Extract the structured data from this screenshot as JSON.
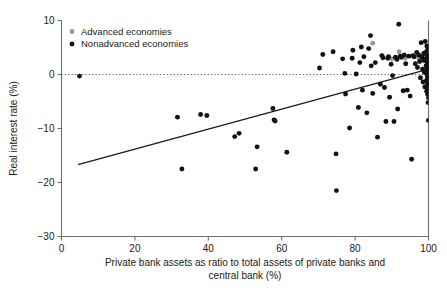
{
  "chart_data": {
    "type": "scatter",
    "title": "",
    "subtitle": "",
    "xlabel": "Private bank assets as ratio to total assets of private banks and central bank (%)",
    "xlabel_line1": "Private bank assets as ratio to total assets of private banks and",
    "xlabel_line2": "central bank (%)",
    "ylabel": "Real interest rate (%)",
    "xlim": [
      0,
      100
    ],
    "ylim": [
      -30,
      10
    ],
    "xticks": [
      0,
      20,
      40,
      60,
      80,
      100
    ],
    "xtick_labels": [
      "0",
      "20",
      "40",
      "60",
      "80",
      "100"
    ],
    "yticks": [
      10,
      0,
      -10,
      -20,
      -30
    ],
    "ytick_labels": [
      "10",
      "0",
      "-10",
      "-20",
      "-30"
    ],
    "grid": false,
    "zero_reference_line": {
      "y": 0,
      "style": "dotted",
      "color": "#555555"
    },
    "legend": {
      "position": "top-left",
      "entries": [
        {
          "name": "Advanced economies",
          "color": "#9a9a9a",
          "marker": "circle"
        },
        {
          "name": "Nonadvanced economies",
          "color": "#111111",
          "marker": "circle"
        }
      ]
    },
    "trendline": {
      "type": "linear",
      "color": "#1a1a1a",
      "x_start": 4.5,
      "y_start": -16.7,
      "x_end": 100.0,
      "y_end": 1.0
    },
    "series": [
      {
        "name": "Nonadvanced economies",
        "color": "#111111",
        "points": [
          [
            4.9,
            -0.3
          ],
          [
            31.6,
            -7.9
          ],
          [
            32.8,
            -17.5
          ],
          [
            37.9,
            -7.4
          ],
          [
            39.6,
            -7.6
          ],
          [
            47.2,
            -11.5
          ],
          [
            48.4,
            -10.9
          ],
          [
            52.9,
            -17.5
          ],
          [
            53.3,
            -13.4
          ],
          [
            57.6,
            -6.3
          ],
          [
            57.9,
            -8.4
          ],
          [
            58.2,
            -8.6
          ],
          [
            61.4,
            -14.4
          ],
          [
            70.3,
            1.2
          ],
          [
            71.2,
            3.7
          ],
          [
            74.0,
            4.2
          ],
          [
            74.8,
            -14.7
          ],
          [
            74.9,
            -21.5
          ],
          [
            76.6,
            2.9
          ],
          [
            77.2,
            0.2
          ],
          [
            77.4,
            -3.6
          ],
          [
            78.5,
            -9.9
          ],
          [
            79.2,
            3.0
          ],
          [
            79.4,
            4.5
          ],
          [
            80.3,
            0.1
          ],
          [
            80.9,
            -6.1
          ],
          [
            81.3,
            2.2
          ],
          [
            81.7,
            5.1
          ],
          [
            82.0,
            -2.9
          ],
          [
            82.4,
            3.3
          ],
          [
            83.2,
            -7.1
          ],
          [
            83.7,
            4.8
          ],
          [
            84.2,
            7.2
          ],
          [
            84.4,
            1.6
          ],
          [
            84.8,
            -3.5
          ],
          [
            85.5,
            2.2
          ],
          [
            86.1,
            -11.6
          ],
          [
            86.9,
            -1.8
          ],
          [
            87.3,
            3.5
          ],
          [
            87.6,
            3.1
          ],
          [
            88.0,
            -2.4
          ],
          [
            88.4,
            -8.7
          ],
          [
            88.9,
            3.0
          ],
          [
            89.1,
            3.3
          ],
          [
            89.4,
            -4.2
          ],
          [
            89.8,
            1.9
          ],
          [
            90.2,
            -0.2
          ],
          [
            90.6,
            -8.7
          ],
          [
            91.0,
            3.2
          ],
          [
            91.4,
            2.8
          ],
          [
            91.6,
            -6.4
          ],
          [
            91.9,
            9.3
          ],
          [
            92.3,
            3.4
          ],
          [
            92.6,
            3.2
          ],
          [
            93.1,
            -3.0
          ],
          [
            93.4,
            3.6
          ],
          [
            93.8,
            2.0
          ],
          [
            94.2,
            -2.9
          ],
          [
            94.6,
            3.4
          ],
          [
            95.0,
            -4.0
          ],
          [
            95.4,
            -15.7
          ],
          [
            95.8,
            3.5
          ],
          [
            96.1,
            3.3
          ],
          [
            96.4,
            2.0
          ],
          [
            96.8,
            4.1
          ],
          [
            97.0,
            1.3
          ],
          [
            97.3,
            3.6
          ],
          [
            97.6,
            2.4
          ],
          [
            97.8,
            -0.6
          ],
          [
            98.0,
            5.9
          ],
          [
            98.2,
            3.2
          ],
          [
            98.4,
            1.0
          ],
          [
            98.5,
            -1.4
          ],
          [
            98.7,
            3.9
          ],
          [
            98.8,
            2.6
          ],
          [
            98.9,
            0.4
          ],
          [
            99.0,
            -2.3
          ],
          [
            99.1,
            6.1
          ],
          [
            99.2,
            4.1
          ],
          [
            99.3,
            2.9
          ],
          [
            99.35,
            1.6
          ],
          [
            99.4,
            0.2
          ],
          [
            99.45,
            -1.1
          ],
          [
            99.5,
            -3.1
          ],
          [
            99.55,
            5.3
          ],
          [
            99.6,
            3.7
          ],
          [
            99.62,
            2.3
          ],
          [
            99.65,
            1.1
          ],
          [
            99.68,
            -0.4
          ],
          [
            99.7,
            -1.9
          ],
          [
            99.72,
            -3.6
          ],
          [
            99.75,
            4.6
          ],
          [
            99.78,
            3.0
          ],
          [
            99.8,
            1.8
          ],
          [
            99.82,
            0.6
          ],
          [
            99.84,
            -0.9
          ],
          [
            99.86,
            -2.6
          ],
          [
            99.88,
            -5.2
          ],
          [
            99.9,
            3.3
          ],
          [
            99.92,
            2.1
          ],
          [
            99.94,
            0.9
          ],
          [
            99.95,
            -0.3
          ],
          [
            99.96,
            -1.6
          ],
          [
            99.97,
            -8.5
          ],
          [
            99.98,
            2.5
          ],
          [
            99.99,
            1.4
          ],
          [
            100.0,
            0.0
          ],
          [
            100.0,
            -2.0
          ],
          [
            100.0,
            -4.3
          ]
        ]
      },
      {
        "name": "Advanced economies",
        "color": "#9a9a9a",
        "points": [
          [
            84.8,
            5.8
          ],
          [
            90.0,
            2.9
          ],
          [
            92.0,
            4.2
          ],
          [
            93.6,
            3.0
          ],
          [
            95.2,
            3.4
          ],
          [
            97.4,
            3.0
          ],
          [
            98.3,
            3.3
          ],
          [
            98.9,
            2.8
          ],
          [
            99.2,
            3.5
          ],
          [
            99.5,
            2.6
          ],
          [
            99.7,
            3.1
          ],
          [
            99.85,
            2.2
          ],
          [
            100.0,
            2.7
          ]
        ]
      }
    ]
  }
}
